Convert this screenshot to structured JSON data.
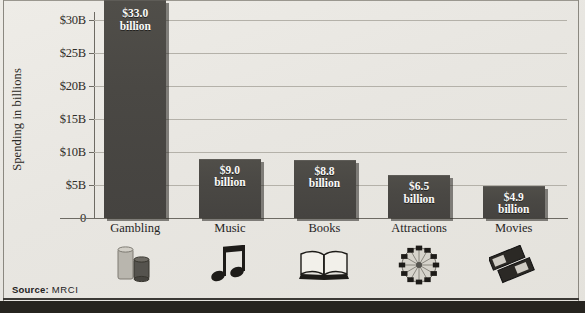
{
  "chart_data": {
    "type": "bar",
    "title": "",
    "xlabel": "",
    "ylabel": "Spending in billions",
    "ylim": [
      0,
      33
    ],
    "grid": true,
    "legend": "none",
    "categories": [
      "Gambling",
      "Music",
      "Books",
      "Attractions",
      "Movies"
    ],
    "values": [
      33.0,
      9.0,
      8.8,
      6.5,
      4.9
    ],
    "value_labels": [
      {
        "amount": "$33.0",
        "unit": "billion"
      },
      {
        "amount": "$9.0",
        "unit": "billion"
      },
      {
        "amount": "$8.8",
        "unit": "billion"
      },
      {
        "amount": "$6.5",
        "unit": "billion"
      },
      {
        "amount": "$4.9",
        "unit": "billion"
      }
    ],
    "yticks": [
      "0",
      "$5B",
      "$10B",
      "$15B",
      "$20B",
      "$25B",
      "$30B"
    ],
    "ytick_values": [
      0,
      5,
      10,
      15,
      20,
      25,
      30
    ],
    "category_icons": [
      "poker-chips-icon",
      "music-notes-icon",
      "open-book-icon",
      "ferris-wheel-icon",
      "movie-tickets-icon"
    ],
    "colors": {
      "bar": "#4b4945",
      "background": "#e9e7e2",
      "gridline": "#b4b1a9",
      "axis": "#6d6a63",
      "label_text": "#fbfbf9"
    }
  },
  "source": {
    "prefix": "Source:",
    "value": "MRCI"
  }
}
